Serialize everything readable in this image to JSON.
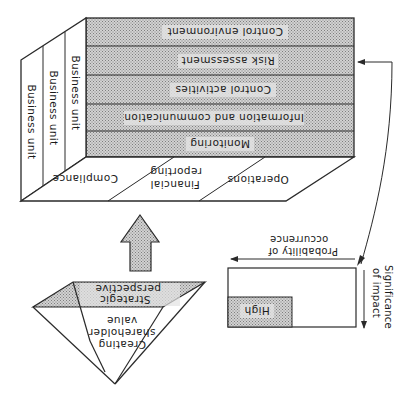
{
  "orientation": "rotated-180",
  "colors": {
    "line": "#2a2a2a",
    "shade_base": "#cfcfcf",
    "shade_dot": "#8a8a8a",
    "label_bg": "#e4e4e4",
    "background": "#ffffff"
  },
  "cube": {
    "components": [
      {
        "label": "Control environment"
      },
      {
        "label": "Risk assessment"
      },
      {
        "label": "Control activities"
      },
      {
        "label": "Information and communication"
      },
      {
        "label": "Monitoring"
      }
    ],
    "objectives": [
      {
        "label": "Compliance"
      },
      {
        "label_line1": "Financial",
        "label_line2": "reporting"
      },
      {
        "label": "Operations"
      }
    ],
    "units": [
      {
        "label": "Business unit"
      },
      {
        "label": "Business unit"
      },
      {
        "label": "Business unit"
      }
    ]
  },
  "pyramid": {
    "top_line1": "Strategic",
    "top_line2": "perspective",
    "side_line1": "Creating",
    "side_line2": "shareholder",
    "side_line3": "value"
  },
  "risk_matrix": {
    "shaded_label": "High",
    "x_axis_line1": "Probability of",
    "x_axis_line2": "occurrence",
    "y_axis_line1": "Significance",
    "y_axis_line2": "of impact"
  },
  "connectors": {
    "up_arrow": "pyramid-to-cube",
    "curved_arrow": "risk-matrix-to-risk-assessment"
  }
}
